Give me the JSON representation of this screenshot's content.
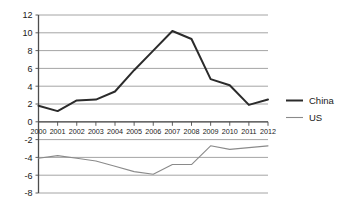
{
  "chart_data": {
    "type": "line",
    "title": "",
    "subtitle": "",
    "xlabel": "",
    "ylabel": "",
    "grid": true,
    "legend_position": "right",
    "ylim": [
      -8,
      12
    ],
    "yticks": [
      12,
      10,
      8,
      6,
      4,
      2,
      0,
      -2,
      -4,
      -6,
      -8
    ],
    "ytick_labels": [
      "12",
      "10",
      "8",
      "6",
      "4",
      "2",
      "0",
      "-2",
      "-4",
      "-6",
      "-8"
    ],
    "categories": [
      "2000",
      "2001",
      "2002",
      "2003",
      "2004",
      "2005",
      "2006",
      "2007",
      "2008",
      "2009",
      "2010",
      "2011",
      "2012"
    ],
    "x": [
      2000,
      2001,
      2002,
      2003,
      2004,
      2005,
      2006,
      2007,
      2008,
      2009,
      2010,
      2011,
      2012
    ],
    "series": [
      {
        "name": "China",
        "color": "#2b2b2b",
        "values": [
          1.8,
          1.2,
          2.4,
          2.5,
          3.4,
          5.8,
          8.0,
          10.2,
          9.3,
          4.8,
          4.1,
          1.9,
          2.5
        ]
      },
      {
        "name": "US",
        "color": "#8a8a8a",
        "values": [
          -4.1,
          -3.8,
          -4.1,
          -4.4,
          -5.0,
          -5.6,
          -5.9,
          -4.8,
          -4.8,
          -2.7,
          -3.1,
          -2.9,
          -2.7
        ]
      }
    ]
  },
  "legend": {
    "items": [
      {
        "label": "China",
        "color": "#2b2b2b"
      },
      {
        "label": "US",
        "color": "#8a8a8a"
      }
    ]
  },
  "axes": {
    "y_labels": [
      "12",
      "10",
      "8",
      "6",
      "4",
      "2",
      "0",
      "-2",
      "-4",
      "-6",
      "-8"
    ],
    "x_labels": [
      "2000",
      "2001",
      "2002",
      "2003",
      "2004",
      "2005",
      "2006",
      "2007",
      "2008",
      "2009",
      "2010",
      "2011",
      "2012"
    ]
  }
}
